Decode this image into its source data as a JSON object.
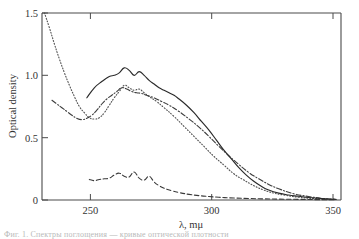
{
  "figure": {
    "caption_fragment": "Фиг. 1. Спектры поглощения — кривые оптической плотности"
  },
  "chart_data": {
    "type": "line",
    "title": "",
    "xlabel": "λ, mμ",
    "ylabel": "Optical density",
    "xlim": [
      235,
      355
    ],
    "ylim": [
      0,
      1.5
    ],
    "xticks": [
      250,
      300,
      350
    ],
    "xtick_labels": [
      "250",
      "300",
      "350"
    ],
    "yticks": [
      0,
      0.5,
      1.0,
      1.5
    ],
    "ytick_labels": [
      "0",
      "0.5",
      "1.0",
      "1.5"
    ],
    "grid": false,
    "legend": "none",
    "series": [
      {
        "name": "solid-curve",
        "style": "solid",
        "color": "#2a2a2a",
        "x": [
          253,
          256,
          259,
          262,
          264,
          266,
          268,
          270,
          272,
          274,
          276,
          278,
          280,
          282,
          284,
          286,
          288,
          290,
          293,
          296,
          299,
          302,
          305,
          308,
          311,
          314,
          317,
          320,
          323,
          326,
          330,
          334,
          338,
          342,
          346,
          350,
          353
        ],
        "y": [
          0.82,
          0.9,
          0.95,
          0.99,
          1.0,
          1.02,
          1.06,
          1.04,
          1.0,
          1.03,
          1.0,
          0.96,
          0.93,
          0.9,
          0.88,
          0.86,
          0.84,
          0.81,
          0.76,
          0.7,
          0.63,
          0.56,
          0.48,
          0.4,
          0.33,
          0.26,
          0.2,
          0.15,
          0.11,
          0.08,
          0.055,
          0.04,
          0.03,
          0.02,
          0.014,
          0.008,
          0.005
        ]
      },
      {
        "name": "dotted-curve",
        "style": "dotted",
        "color": "#555555",
        "x": [
          236,
          238,
          240,
          242,
          244,
          246,
          248,
          250,
          252,
          254,
          256,
          258,
          260,
          262,
          264,
          266,
          268,
          270,
          272,
          274,
          276,
          278,
          281,
          284,
          288,
          292,
          296,
          300,
          304,
          308,
          312,
          316,
          320,
          324,
          328,
          332,
          338,
          344,
          350,
          353
        ],
        "y": [
          1.5,
          1.38,
          1.25,
          1.13,
          1.02,
          0.92,
          0.83,
          0.75,
          0.7,
          0.66,
          0.65,
          0.66,
          0.7,
          0.76,
          0.82,
          0.87,
          0.92,
          0.9,
          0.88,
          0.89,
          0.86,
          0.83,
          0.79,
          0.74,
          0.67,
          0.59,
          0.51,
          0.43,
          0.35,
          0.28,
          0.21,
          0.16,
          0.115,
          0.08,
          0.055,
          0.04,
          0.022,
          0.012,
          0.006,
          0.004
        ]
      },
      {
        "name": "dash-dot-curve",
        "style": "dashdot",
        "color": "#3d3d3d",
        "x": [
          239,
          241,
          243,
          245,
          247,
          249,
          251,
          253,
          255,
          257,
          259,
          261,
          263,
          265,
          267,
          269,
          271,
          273,
          275,
          277,
          280,
          283,
          286,
          290,
          294,
          298,
          302,
          306,
          310,
          314,
          318,
          322,
          326,
          330,
          336,
          342,
          348,
          353
        ],
        "y": [
          0.8,
          0.77,
          0.74,
          0.71,
          0.68,
          0.655,
          0.645,
          0.655,
          0.68,
          0.72,
          0.77,
          0.81,
          0.84,
          0.87,
          0.9,
          0.89,
          0.87,
          0.86,
          0.855,
          0.84,
          0.82,
          0.79,
          0.76,
          0.71,
          0.65,
          0.585,
          0.51,
          0.43,
          0.355,
          0.285,
          0.22,
          0.17,
          0.125,
          0.09,
          0.05,
          0.028,
          0.012,
          0.006
        ]
      },
      {
        "name": "dashed-low-curve",
        "style": "dashed",
        "color": "#3a3a3a",
        "x": [
          254,
          256,
          258,
          260,
          262,
          264,
          266,
          268,
          270,
          272,
          274,
          276,
          278,
          280,
          282,
          284,
          287,
          290,
          294,
          298,
          302,
          306,
          312,
          318,
          324,
          330,
          338,
          346,
          353
        ],
        "y": [
          0.165,
          0.155,
          0.165,
          0.17,
          0.175,
          0.2,
          0.215,
          0.19,
          0.185,
          0.225,
          0.175,
          0.16,
          0.19,
          0.145,
          0.115,
          0.095,
          0.075,
          0.06,
          0.045,
          0.035,
          0.028,
          0.022,
          0.016,
          0.012,
          0.009,
          0.007,
          0.005,
          0.003,
          0.002
        ]
      }
    ]
  }
}
